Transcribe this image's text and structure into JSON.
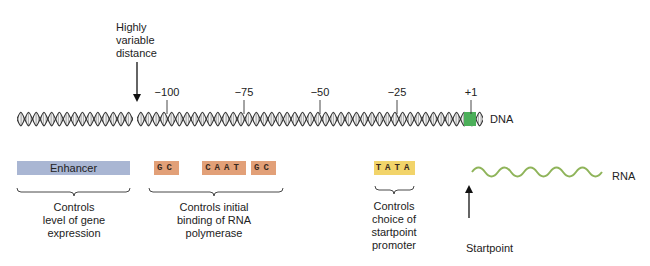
{
  "diagram": {
    "annotation_top": {
      "lines": [
        "Highly",
        "variable",
        "distance"
      ]
    },
    "positions": [
      {
        "label": "−100",
        "x": 167
      },
      {
        "label": "−75",
        "x": 244
      },
      {
        "label": "−50",
        "x": 320
      },
      {
        "label": "−25",
        "x": 397
      },
      {
        "label": "+1",
        "x": 471
      }
    ],
    "dna_label": "DNA",
    "rna_label": "RNA",
    "elements": {
      "enhancer": {
        "label": "Enhancer",
        "color": "#a9b6d3"
      },
      "gc_1": {
        "label": "GC",
        "color": "#e2a078"
      },
      "caat": {
        "label": "CAAT",
        "color": "#e2a078"
      },
      "gc_2": {
        "label": "GC",
        "color": "#e2a078"
      },
      "tata": {
        "label": "TATA",
        "color": "#f2d46a"
      }
    },
    "captions": {
      "enhancer": [
        "Controls",
        "level of gene",
        "expression"
      ],
      "gc_caat": [
        "Controls initial",
        "binding of RNA",
        "polymerase"
      ],
      "tata": [
        "Controls",
        "choice of",
        "startpoint",
        "promoter"
      ]
    },
    "startpoint_label": "Startpoint",
    "colors": {
      "startpoint_marker": "#4caf5a",
      "rna_wave": "#8fb45a",
      "helix": "#333333"
    }
  }
}
